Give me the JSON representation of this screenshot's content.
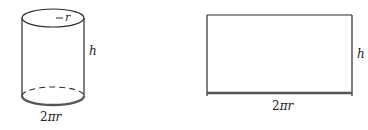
{
  "cylinder": {
    "radius_label": "r",
    "height_label": "h",
    "circumference_label_num": "2",
    "circumference_label_sym": "πr"
  },
  "rectangle": {
    "height_label": "h",
    "width_label_num": "2",
    "width_label_sym": "πr"
  },
  "colors": {
    "stroke": "#2a2a2a",
    "highlight_edge": "#555555",
    "background": "#ffffff"
  }
}
